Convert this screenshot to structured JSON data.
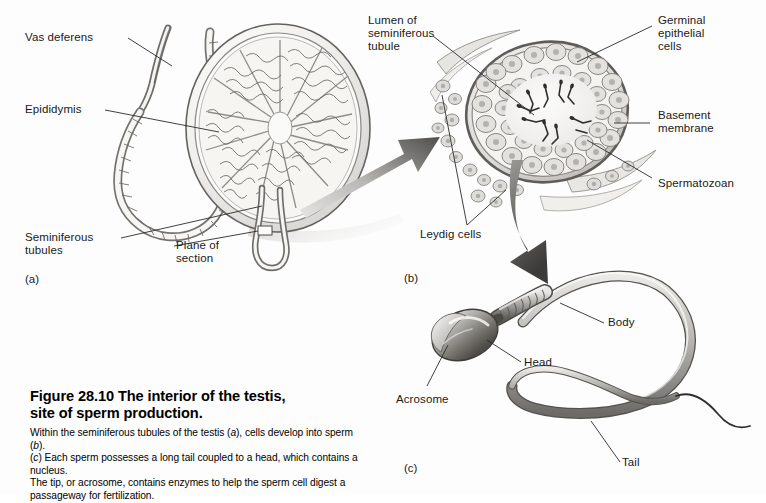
{
  "figure": {
    "title": "Figure 28.10   The interior of the testis, site of sperm production.",
    "title_line1": "Figure 28.10   The interior of the testis,",
    "title_line2": "site of sperm production.",
    "caption_line1_a": "Within the seminiferous tubules of the testis (",
    "caption_line1_i": "a",
    "caption_line1_b": "), cells develop into sperm (",
    "caption_line1_i2": "b",
    "caption_line1_c": ").",
    "caption_line2_i": "c",
    "caption_line2_a": "(",
    "caption_line2_b": ") Each sperm possesses a long tail coupled to a head, which contains a nucleus.",
    "caption_line3": "The tip, or acrosome, contains enzymes to help the sperm cell digest a",
    "caption_line4": "passageway for fertilization."
  },
  "panels": {
    "a": {
      "mark": "(a)",
      "name": "testis-with-epididymis"
    },
    "b": {
      "mark": "(b)",
      "name": "seminiferous-tubule-cross-section"
    },
    "c": {
      "mark": "(c)",
      "name": "spermatozoon"
    }
  },
  "labels": {
    "vas_deferens": "Vas deferens",
    "epididymis": "Epididymis",
    "seminiferous_tubules_l1": "Seminiferous",
    "seminiferous_tubules_l2": "tubules",
    "plane_of_section_l1": "Plane of",
    "plane_of_section_l2": "section",
    "lumen_l1": "Lumen of",
    "lumen_l2": "seminiferous",
    "lumen_l3": "tubule",
    "germinal_l1": "Germinal",
    "germinal_l2": "epithelial",
    "germinal_l3": "cells",
    "basement_l1": "Basement",
    "basement_l2": "membrane",
    "spermatozoan": "Spermatozoan",
    "leydig_cells": "Leydig cells",
    "acrosome": "Acrosome",
    "head": "Head",
    "body": "Body",
    "tail": "Tail"
  },
  "colors": {
    "background": "#fdfdfd",
    "ink": "#1a1a1a",
    "line": "#2b2b2b",
    "tissue_light": "#f2f1ef",
    "tissue_mid": "#d2d0cd",
    "tissue_dark": "#8d8a86",
    "arrow_light": "#cfcdca",
    "arrow_dark": "#4a4a4a",
    "sperm_light": "#efeeec",
    "sperm_dark": "#6e6c69"
  }
}
